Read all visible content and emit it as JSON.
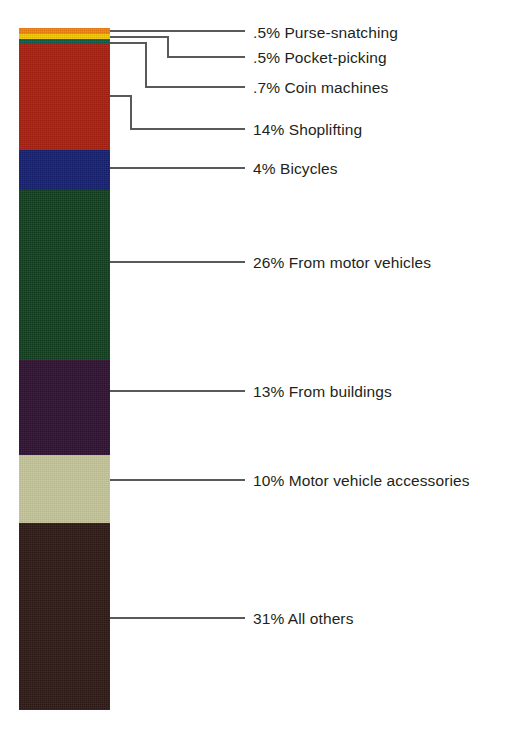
{
  "figure": {
    "type": "stacked-bar-single-column",
    "background_color": "#ffffff",
    "text_color": "#231f20",
    "leader_line_color": "#58595b"
  },
  "chart_data": {
    "type": "bar",
    "title": "",
    "subtitle": "",
    "xlabel": "",
    "ylabel": "",
    "stacked": true,
    "orientation": "vertical",
    "units": "percent",
    "total": 100,
    "axis_range": [
      0,
      100
    ],
    "grid": false,
    "legend_position": "right-callouts",
    "categories": [
      "Purse-snatching",
      "Pocket-picking",
      "Coin machines",
      "Shoplifting",
      "Bicycles",
      "From motor vehicles",
      "From buildings",
      "Motor vehicle accessories",
      "All others"
    ],
    "values": [
      0.5,
      0.5,
      0.7,
      14,
      4,
      26,
      13,
      10,
      31
    ],
    "value_labels": [
      "and .5%",
      ".5%",
      ".7%",
      "14%",
      "4%",
      "26%",
      "13%",
      "10%",
      "31%"
    ],
    "colors": [
      "#f07f13",
      "#f2c600",
      "#0d5a52",
      "#a81f0e",
      "#161f6e",
      "#12401f",
      "#2d1230",
      "#c4c49a",
      "#2e1a16"
    ]
  },
  "segments": [
    {
      "id": "purse-snatching",
      "value_label": ".5%",
      "name": "Purse-snatching",
      "full_label": ".5% Purse-snatching",
      "color": "#f07f13",
      "top_px": 0,
      "height_px": 6
    },
    {
      "id": "pocket-picking",
      "value_label": ".5%",
      "name": "Pocket-picking",
      "full_label": ".5% Pocket-picking",
      "color": "#f2c600",
      "top_px": 6,
      "height_px": 5
    },
    {
      "id": "coin-machines",
      "value_label": ".7%",
      "name": "Coin machines",
      "full_label": ".7% Coin machines",
      "color": "#0d5a52",
      "top_px": 11,
      "height_px": 5
    },
    {
      "id": "shoplifting",
      "value_label": "14%",
      "name": "Shoplifting",
      "full_label": "14% Shoplifting",
      "color": "#a81f0e",
      "top_px": 16,
      "height_px": 106
    },
    {
      "id": "bicycles",
      "value_label": "4%",
      "name": "Bicycles",
      "full_label": "4% Bicycles",
      "color": "#161f6e",
      "top_px": 122,
      "height_px": 40
    },
    {
      "id": "from-motor-vehicles",
      "value_label": "26%",
      "name": "From motor vehicles",
      "full_label": "26% From motor vehicles",
      "color": "#12401f",
      "top_px": 162,
      "height_px": 170
    },
    {
      "id": "from-buildings",
      "value_label": "13%",
      "name": "From buildings",
      "full_label": "13% From buildings",
      "color": "#2d1230",
      "top_px": 332,
      "height_px": 95
    },
    {
      "id": "motor-vehicle-accessories",
      "value_label": "10%",
      "name": "Motor vehicle accessories",
      "full_label": "10% Motor vehicle accessories",
      "color": "#c4c49a",
      "top_px": 427,
      "height_px": 68
    },
    {
      "id": "all-others",
      "value_label": "31%",
      "name": "All others",
      "full_label": "31% All others",
      "color": "#2e1a16",
      "top_px": 495,
      "height_px": 187
    }
  ],
  "labels": [
    {
      "id": "purse-snatching",
      "text": ".5% Purse-snatching",
      "y_px": 25
    },
    {
      "id": "pocket-picking",
      "text": ".5% Pocket-picking",
      "y_px": 50
    },
    {
      "id": "coin-machines",
      "text": ".7% Coin machines",
      "y_px": 80
    },
    {
      "id": "shoplifting",
      "text": "14% Shoplifting",
      "y_px": 122
    },
    {
      "id": "bicycles",
      "text": "4% Bicycles",
      "y_px": 161
    },
    {
      "id": "from-motor-vehicles",
      "text": "26% From motor vehicles",
      "y_px": 255
    },
    {
      "id": "from-buildings",
      "text": "13% From buildings",
      "y_px": 384
    },
    {
      "id": "motor-vehicle-accessories",
      "text": "10% Motor vehicle accessories",
      "y_px": 473
    },
    {
      "id": "all-others",
      "text": "31% All others",
      "y_px": 611
    }
  ]
}
